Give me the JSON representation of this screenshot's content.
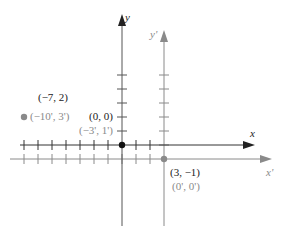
{
  "diagram": {
    "type": "coordinate-translation",
    "unit_px": 14,
    "colors": {
      "original_axes": "#333333",
      "translated_axes": "#8a8a8a",
      "original_text": "#222222",
      "translated_text": "#8a8a8a"
    },
    "axes": {
      "x_label": "x",
      "y_label": "y",
      "x_prime_label": "x'",
      "y_prime_label": "y'"
    },
    "points": [
      {
        "id": "origin",
        "label": "(0, 0)",
        "prime_label": "(−3', 1')",
        "x": 0,
        "y": 0
      },
      {
        "id": "p1",
        "label": "(−7, 2)",
        "prime_label": "(−10', 3')",
        "x": -7,
        "y": 2
      },
      {
        "id": "new-origin",
        "label": "(3, −1)",
        "prime_label": "(0', 0')",
        "x": 3,
        "y": -1
      }
    ],
    "translation": {
      "h": 3,
      "k": -1
    }
  }
}
